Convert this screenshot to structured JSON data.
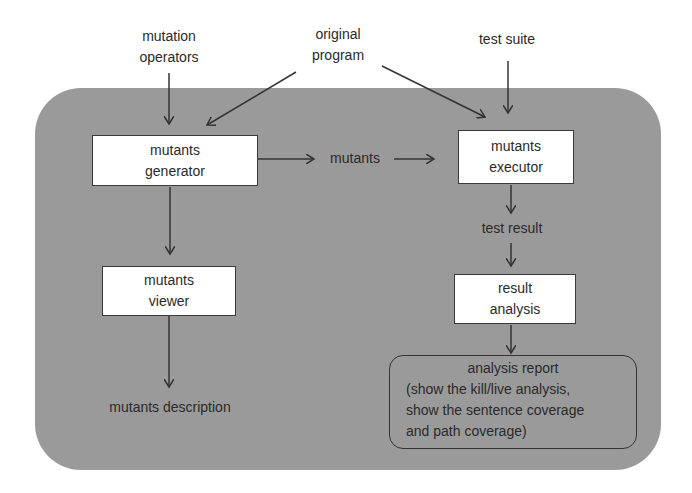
{
  "diagram": {
    "inputs": {
      "mutation_operators": [
        "mutation",
        "operators"
      ],
      "original_program": [
        "original",
        "program"
      ],
      "test_suite": "test suite"
    },
    "nodes": {
      "mutants_generator": [
        "mutants",
        "generator"
      ],
      "mutants_executor": [
        "mutants",
        "executor"
      ],
      "mutants_viewer": [
        "mutants",
        "viewer"
      ],
      "result_analysis": [
        "result",
        "analysis"
      ]
    },
    "edge_labels": {
      "mutants": "mutants",
      "test_result": "test result"
    },
    "outputs": {
      "mutants_description": "mutants description",
      "analysis_report": {
        "title": "analysis report",
        "lines": [
          "(show the kill/live analysis,",
          "show the sentence coverage",
          "and path coverage)"
        ]
      }
    },
    "colors": {
      "panel": "#9a9a9a",
      "box_fill": "#ffffff",
      "stroke": "#333333"
    }
  }
}
